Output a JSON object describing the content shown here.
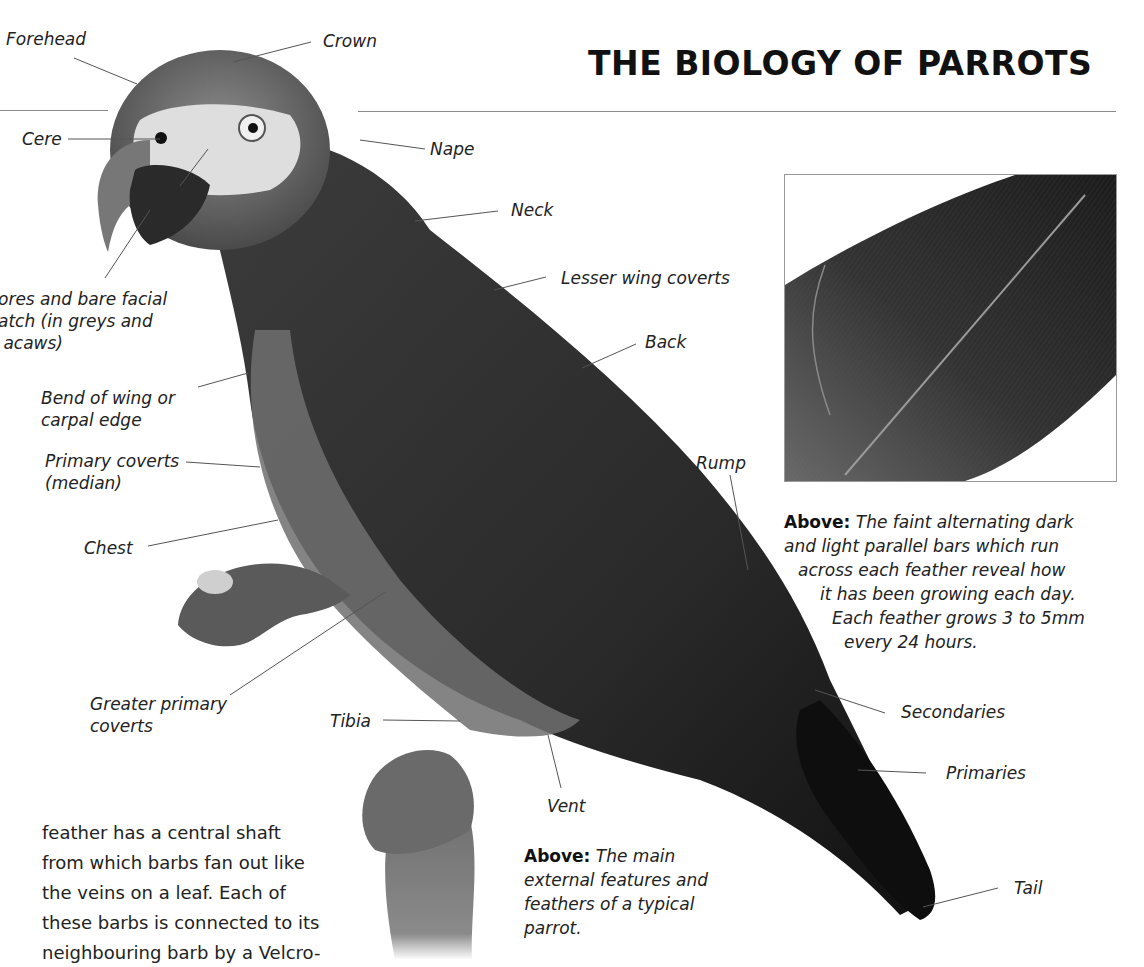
{
  "page": {
    "title": "THE BIOLOGY OF PARROTS"
  },
  "labels": {
    "forehead": "Forehead",
    "crown": "Crown",
    "cere": "Cere",
    "nape": "Nape",
    "neck": "Neck",
    "facial_patch": "ores and bare facial\natch (in greys and\n acaws)",
    "lesser_wing_coverts": "Lesser wing coverts",
    "back": "Back",
    "bend_of_wing": "Bend of wing or\ncarpal edge",
    "primary_coverts": "Primary coverts\n(median)",
    "rump": "Rump",
    "chest": "Chest",
    "greater_primary_coverts": "Greater primary\ncoverts",
    "tibia": "Tibia",
    "secondaries": "Secondaries",
    "primaries": "Primaries",
    "vent": "Vent",
    "tail": "Tail"
  },
  "captions": {
    "feather": {
      "lead": "Above:",
      "lines": [
        "The faint alternating dark",
        "and light parallel bars which run",
        "across each feather reveal how",
        "it has been growing each day.",
        "Each feather grows 3 to 5mm",
        "every 24 hours."
      ]
    },
    "main": {
      "lead": "Above:",
      "text": "The main external features and feathers of a typical parrot."
    }
  },
  "body_text": "feather has a central shaft\nfrom which barbs fan out like\nthe veins on a leaf. Each of\nthese barbs is connected to its\nneighbouring barb by a Velcro-",
  "images": {
    "parrot": "grey-parrot-photo",
    "feather": "feather-closeup-photo"
  }
}
